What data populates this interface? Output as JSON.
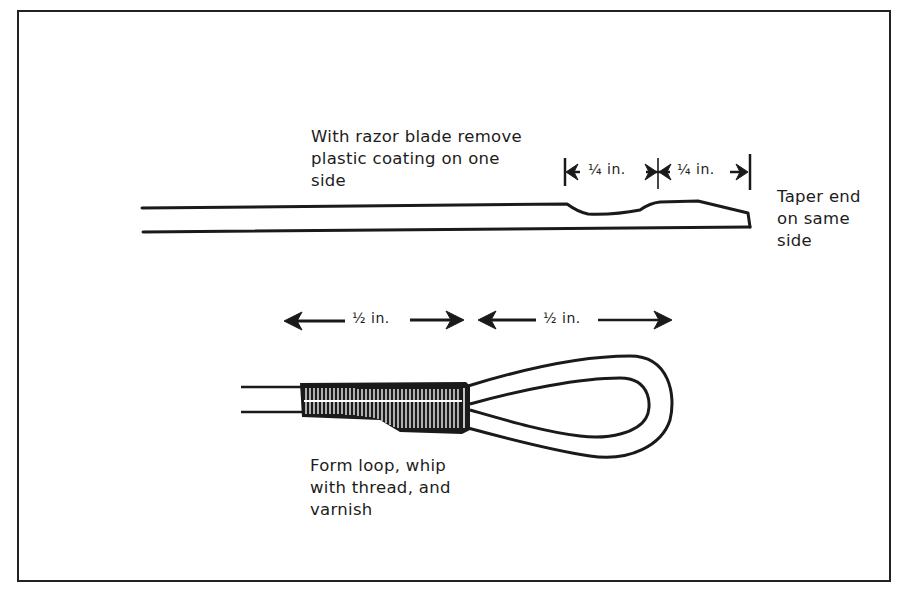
{
  "figure": {
    "labels": {
      "remove_coating": [
        "With razor blade remove",
        "plastic coating on one",
        "side"
      ],
      "taper_end": [
        "Taper end",
        "on same",
        "side"
      ],
      "form_loop": [
        "Form loop, whip",
        "with thread, and",
        "varnish"
      ]
    },
    "dimensions": {
      "quarter_1": "¼  in.",
      "quarter_2": "¼  in.",
      "half_1": "½  in.",
      "half_2": "½  in."
    },
    "colors": {
      "ink": "#1a1a1a",
      "background": "#ffffff"
    }
  }
}
